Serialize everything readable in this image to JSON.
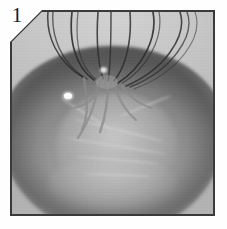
{
  "figure": {
    "panel_label": "1",
    "caption": "",
    "alt_description": "Grayscale photograph of a wire whisk mixing batter inside a bowl, viewed from above",
    "image_type": "grayscale-photograph",
    "corner_style": "chamfered-top-left",
    "colors": {
      "page_background": "#ffffff",
      "photo_border": "#3a3a3a",
      "photo_light": "#d2d2d2",
      "photo_mid": "#b3b3b3",
      "photo_dark": "#5a5a5a",
      "wire_color": "#2e2e2e",
      "highlight": "#fdfdfd",
      "label_color": "#1a1a1a"
    },
    "geometry": {
      "photo_left": 10,
      "photo_top": 10,
      "photo_width": 205,
      "photo_height": 206,
      "chamfer_size": 32
    },
    "whisk": {
      "wire_count": 9,
      "hub_x_percent": 47,
      "hub_y_percent": 33
    },
    "highlight_spot": {
      "x_percent": 26,
      "y_percent": 40
    }
  }
}
